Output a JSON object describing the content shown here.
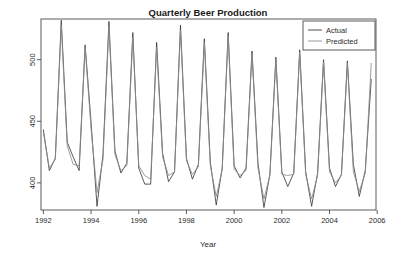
{
  "chart_data": {
    "type": "line",
    "title": "Quarterly Beer Production",
    "xlabel": "Year",
    "ylabel": "",
    "xlim": [
      1991.9,
      2005.95
    ],
    "ylim": [
      378,
      533
    ],
    "grid": false,
    "legend_position": "top-right",
    "xticks": [
      1992,
      1994,
      1996,
      1998,
      2000,
      2002,
      2004,
      2006
    ],
    "xtick_labels": [
      "1992",
      "1994",
      "1996",
      "1998",
      "2000",
      "2002",
      "2004",
      "2006"
    ],
    "yticks": [
      400,
      450,
      500
    ],
    "ytick_labels": [
      "400",
      "450",
      "500"
    ],
    "x": [
      1992.0,
      1992.25,
      1992.5,
      1992.75,
      1993.0,
      1993.25,
      1993.5,
      1993.75,
      1994.0,
      1994.25,
      1994.5,
      1994.75,
      1995.0,
      1995.25,
      1995.5,
      1995.75,
      1996.0,
      1996.25,
      1996.5,
      1996.75,
      1997.0,
      1997.25,
      1997.5,
      1997.75,
      1998.0,
      1998.25,
      1998.5,
      1998.75,
      1999.0,
      1999.25,
      1999.5,
      1999.75,
      2000.0,
      2000.25,
      2000.5,
      2000.75,
      2001.0,
      2001.25,
      2001.5,
      2001.75,
      2002.0,
      2002.25,
      2002.5,
      2002.75,
      2003.0,
      2003.25,
      2003.5,
      2003.75,
      2004.0,
      2004.25,
      2004.5,
      2004.75,
      2005.0,
      2005.25,
      2005.5,
      2005.75
    ],
    "series": [
      {
        "name": "Actual",
        "color": "#3b3b3b",
        "values": [
          443,
          410,
          420,
          532,
          433,
          421,
          410,
          512,
          449,
          381,
          423,
          531,
          426,
          408,
          416,
          522,
          412,
          399,
          399,
          514,
          424,
          401,
          409,
          528,
          420,
          403,
          415,
          517,
          417,
          382,
          412,
          522,
          414,
          404,
          412,
          507,
          416,
          380,
          407,
          502,
          409,
          397,
          408,
          508,
          409,
          381,
          408,
          500,
          412,
          397,
          407,
          499,
          415,
          389,
          410,
          484
        ]
      },
      {
        "name": "Predicted",
        "color": "#8c8c8c",
        "values": [
          441,
          412,
          419,
          528,
          430,
          415,
          414,
          510,
          444,
          392,
          419,
          527,
          423,
          410,
          414,
          518,
          414,
          406,
          403,
          510,
          421,
          406,
          409,
          524,
          418,
          407,
          413,
          514,
          414,
          389,
          411,
          519,
          411,
          406,
          410,
          505,
          412,
          387,
          406,
          500,
          407,
          406,
          407,
          506,
          407,
          387,
          406,
          498,
          409,
          400,
          406,
          497,
          409,
          393,
          408,
          497
        ]
      }
    ]
  },
  "legend": {
    "entries": [
      {
        "label": "Actual"
      },
      {
        "label": "Predicted"
      }
    ]
  }
}
